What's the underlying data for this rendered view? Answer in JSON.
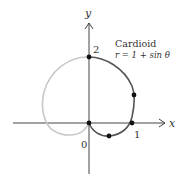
{
  "figure": {
    "title": "Cardioid",
    "equation": "r = 1 + sin θ",
    "axes": {
      "x_label": "x",
      "y_label": "y"
    },
    "tick_labels": {
      "origin": "0",
      "x_one": "1",
      "y_two": "2"
    },
    "colors": {
      "axes": "#444444",
      "curve_dark": "#555555",
      "curve_light": "#c8c8c8",
      "points": "#111111"
    },
    "highlighted_points": [
      {
        "label": "origin",
        "theta": "-π/2",
        "x": 0,
        "y": 0
      },
      {
        "label": "bottom",
        "theta": "-π/6",
        "x": 0.43,
        "y": -0.25
      },
      {
        "label": "x-intercept",
        "theta": "0",
        "x": 1,
        "y": 0
      },
      {
        "label": "right",
        "theta": "π/6",
        "x": 1.3,
        "y": 0.75
      },
      {
        "label": "top",
        "theta": "π/2",
        "x": 0,
        "y": 2
      }
    ]
  }
}
